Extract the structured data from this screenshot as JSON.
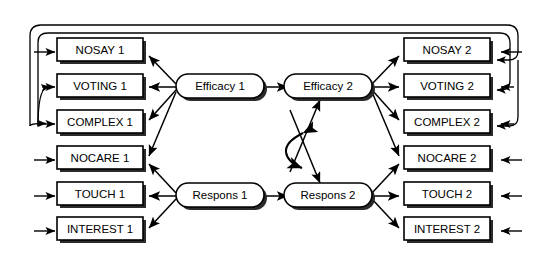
{
  "diagram": {
    "caption_fragment": "",
    "colors": {
      "stroke": "#000000",
      "background": "#ffffff",
      "shadow": "#2b2b2b"
    },
    "observed_variables": {
      "wave1": [
        {
          "id": "nosay-1",
          "label": "NOSAY 1"
        },
        {
          "id": "voting-1",
          "label": "VOTING 1"
        },
        {
          "id": "complex-1",
          "label": "COMPLEX 1"
        },
        {
          "id": "nocare-1",
          "label": "NOCARE 1"
        },
        {
          "id": "touch-1",
          "label": "TOUCH 1"
        },
        {
          "id": "interest-1",
          "label": "INTEREST 1"
        }
      ],
      "wave2": [
        {
          "id": "nosay-2",
          "label": "NOSAY 2"
        },
        {
          "id": "voting-2",
          "label": "VOTING 2"
        },
        {
          "id": "complex-2",
          "label": "COMPLEX 2"
        },
        {
          "id": "nocare-2",
          "label": "NOCARE 2"
        },
        {
          "id": "touch-2",
          "label": "TOUCH 2"
        },
        {
          "id": "interest-2",
          "label": "INTEREST 2"
        }
      ]
    },
    "latent_variables": [
      {
        "id": "efficacy-1",
        "label": "Efficacy 1"
      },
      {
        "id": "efficacy-2",
        "label": "Efficacy 2"
      },
      {
        "id": "respons-1",
        "label": "Respons 1"
      },
      {
        "id": "respons-2",
        "label": "Respons 2"
      }
    ],
    "paths": {
      "structural": [
        {
          "from": "Efficacy 1",
          "to": "Efficacy 2"
        },
        {
          "from": "Respons 1",
          "to": "Respons 2"
        },
        {
          "from": "Efficacy 1",
          "to": "Respons 2"
        },
        {
          "from": "Respons 1",
          "to": "Efficacy 2"
        }
      ],
      "measurement_wave1": [
        {
          "from": "Efficacy 1",
          "to": "NOSAY 1"
        },
        {
          "from": "Efficacy 1",
          "to": "VOTING 1"
        },
        {
          "from": "Efficacy 1",
          "to": "COMPLEX 1"
        },
        {
          "from": "Efficacy 1",
          "to": "NOCARE 1"
        },
        {
          "from": "Respons 1",
          "to": "NOCARE 1"
        },
        {
          "from": "Respons 1",
          "to": "TOUCH 1"
        },
        {
          "from": "Respons 1",
          "to": "INTEREST 1"
        }
      ],
      "measurement_wave2": [
        {
          "from": "Efficacy 2",
          "to": "NOSAY 2"
        },
        {
          "from": "Efficacy 2",
          "to": "VOTING 2"
        },
        {
          "from": "Efficacy 2",
          "to": "COMPLEX 2"
        },
        {
          "from": "Efficacy 2",
          "to": "NOCARE 2"
        },
        {
          "from": "Respons 2",
          "to": "NOCARE 2"
        },
        {
          "from": "Respons 2",
          "to": "TOUCH 2"
        },
        {
          "from": "Respons 2",
          "to": "INTEREST 2"
        }
      ],
      "correlated_disturbance": [
        {
          "between": "Efficacy 2",
          "and": "Respons 2",
          "shape": "curved-double-arrow"
        }
      ],
      "correlated_errors": [
        {
          "between": "NOSAY 1",
          "and": "NOSAY 2",
          "shape": "outer-loop"
        },
        {
          "between": "VOTING 1",
          "and": "VOTING 2",
          "shape": "outer-loop"
        },
        {
          "between": "COMPLEX 1",
          "and": "COMPLEX 2",
          "shape": "outer-loop"
        }
      ]
    },
    "residual_arrows": {
      "wave1_side": "left",
      "wave2_side": "right",
      "count": 12
    }
  }
}
